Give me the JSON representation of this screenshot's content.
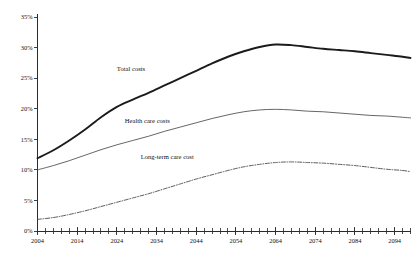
{
  "chart_data": {
    "type": "line",
    "title": "",
    "xlabel": "",
    "ylabel": "",
    "xlim": [
      2004,
      2098
    ],
    "ylim": [
      0,
      35
    ],
    "grid": false,
    "legend_position": "inline-annotations",
    "y_tick_labels": [
      "35%",
      "30%",
      "25%",
      "20%",
      "15%",
      "10%",
      "5%",
      "0%"
    ],
    "y_tick_values": [
      35,
      30,
      25,
      20,
      15,
      10,
      5,
      0
    ],
    "x_tick_labels": [
      "2004",
      "2014",
      "2024",
      "2034",
      "2044",
      "2054",
      "2064",
      "2074",
      "2084",
      "2094"
    ],
    "x_tick_values": [
      2004,
      2014,
      2024,
      2034,
      2044,
      2054,
      2064,
      2074,
      2084,
      2094
    ],
    "x_minor_tick_step": 2,
    "x": [
      2004,
      2008,
      2012,
      2016,
      2020,
      2024,
      2028,
      2032,
      2036,
      2040,
      2044,
      2048,
      2052,
      2056,
      2060,
      2064,
      2068,
      2072,
      2076,
      2080,
      2084,
      2088,
      2092,
      2096,
      2098
    ],
    "series": [
      {
        "name": "Total costs",
        "style": "solid-thick",
        "color": "#1b1b1b",
        "label_x": 2024,
        "label_y": 26.2,
        "values": [
          11.9,
          13.2,
          14.8,
          16.6,
          18.6,
          20.3,
          21.5,
          22.6,
          23.8,
          25.0,
          26.2,
          27.4,
          28.5,
          29.4,
          30.1,
          30.5,
          30.4,
          30.1,
          29.8,
          29.6,
          29.4,
          29.1,
          28.8,
          28.5,
          28.3
        ]
      },
      {
        "name": "Health care costs",
        "style": "solid-thin",
        "color": "#4a4a4a",
        "label_x": 2026,
        "label_y": 17.6,
        "values": [
          10.0,
          10.7,
          11.5,
          12.4,
          13.3,
          14.1,
          14.8,
          15.5,
          16.3,
          17.0,
          17.7,
          18.4,
          19.0,
          19.5,
          19.8,
          19.9,
          19.8,
          19.6,
          19.5,
          19.3,
          19.1,
          18.9,
          18.8,
          18.6,
          18.5
        ]
      },
      {
        "name": "Long-term care cost",
        "style": "dash-dot",
        "color": "#3d3d3d",
        "label_x": 2030,
        "label_y": 11.8,
        "values": [
          1.9,
          2.2,
          2.7,
          3.3,
          4.0,
          4.7,
          5.4,
          6.1,
          6.9,
          7.7,
          8.5,
          9.2,
          9.9,
          10.5,
          10.9,
          11.2,
          11.3,
          11.2,
          11.1,
          10.9,
          10.7,
          10.4,
          10.1,
          9.9,
          9.7
        ]
      }
    ]
  }
}
